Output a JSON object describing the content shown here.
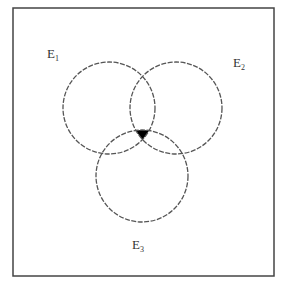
{
  "diagram": {
    "type": "venn",
    "sets": [
      {
        "name": "E1",
        "label": "E",
        "subscript": "1"
      },
      {
        "name": "E2",
        "label": "E",
        "subscript": "2"
      },
      {
        "name": "E3",
        "label": "E",
        "subscript": "3"
      }
    ],
    "highlighted_region": "E1 ∩ E2 ∩ E3",
    "colors": {
      "frame": "#444444",
      "circle": "#555555",
      "fill": "#000000"
    }
  }
}
